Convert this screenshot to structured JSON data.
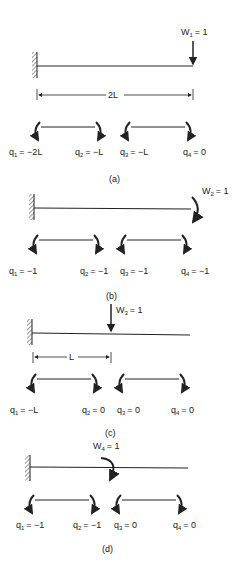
{
  "figure": {
    "panels": [
      {
        "id": "a",
        "caption": "(a)",
        "load": {
          "name": "W",
          "sub": "1",
          "value": "= 1",
          "type": "force"
        },
        "dimension": "2L",
        "q": [
          {
            "name": "q",
            "sub": "1",
            "value": "= −2L"
          },
          {
            "name": "q",
            "sub": "2",
            "value": "= −L"
          },
          {
            "name": "q",
            "sub": "3",
            "value": "= −L"
          },
          {
            "name": "q",
            "sub": "4",
            "value": "= 0"
          }
        ]
      },
      {
        "id": "b",
        "caption": "(b)",
        "load": {
          "name": "W",
          "sub": "2",
          "value": "= 1",
          "type": "moment"
        },
        "q": [
          {
            "name": "q",
            "sub": "1",
            "value": "= −1"
          },
          {
            "name": "q",
            "sub": "2",
            "value": "= −1"
          },
          {
            "name": "q",
            "sub": "3",
            "value": "= −1"
          },
          {
            "name": "q",
            "sub": "4",
            "value": "= −1"
          }
        ]
      },
      {
        "id": "c",
        "caption": "(c)",
        "load": {
          "name": "W",
          "sub": "3",
          "value": "= 1",
          "type": "force"
        },
        "dimension": "L",
        "q": [
          {
            "name": "q",
            "sub": "1",
            "value": "= −L"
          },
          {
            "name": "q",
            "sub": "2",
            "value": "= 0"
          },
          {
            "name": "q",
            "sub": "3",
            "value": "= 0"
          },
          {
            "name": "q",
            "sub": "4",
            "value": "= 0"
          }
        ]
      },
      {
        "id": "d",
        "caption": "(d)",
        "load": {
          "name": "W",
          "sub": "4",
          "value": "= 1",
          "type": "moment"
        },
        "q": [
          {
            "name": "q",
            "sub": "1",
            "value": "= −1"
          },
          {
            "name": "q",
            "sub": "2",
            "value": "= −1"
          },
          {
            "name": "q",
            "sub": "3",
            "value": "= 0"
          },
          {
            "name": "q",
            "sub": "4",
            "value": "= 0"
          }
        ]
      }
    ],
    "colors": {
      "ink": "#222222",
      "background": "#ffffff"
    }
  }
}
